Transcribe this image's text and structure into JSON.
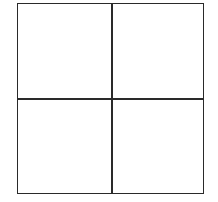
{
  "diagram": {
    "type": "2x2 grid",
    "rows": 2,
    "columns": 2,
    "cells": [
      {
        "row": 0,
        "col": 0,
        "label": ""
      },
      {
        "row": 0,
        "col": 1,
        "label": ""
      },
      {
        "row": 1,
        "col": 0,
        "label": ""
      },
      {
        "row": 1,
        "col": 1,
        "label": ""
      }
    ],
    "line_color": "#2a2a2a",
    "background": "#ffffff"
  }
}
